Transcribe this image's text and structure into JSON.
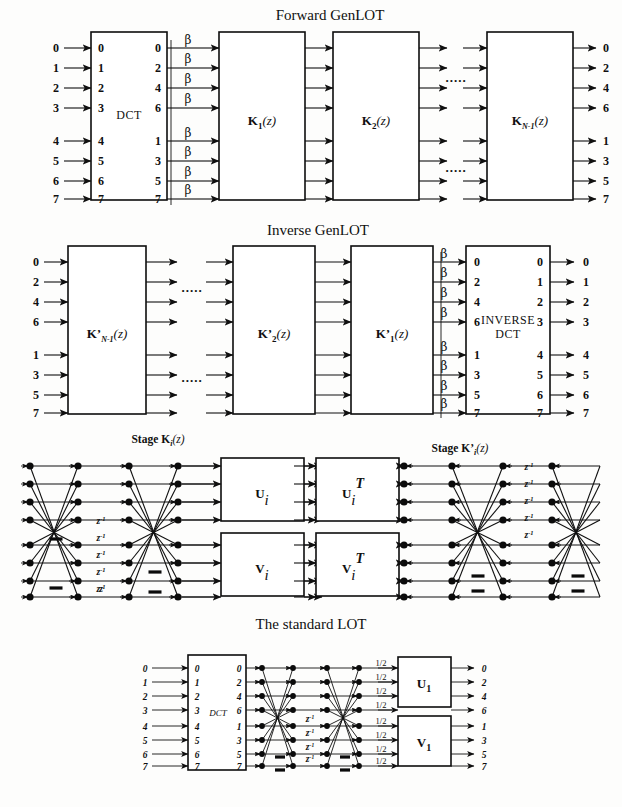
{
  "figure": {
    "kind": "signal-flow-block-diagram",
    "background": "#fdfdfc",
    "ink": "#101010"
  },
  "sections": {
    "forward": {
      "title": "Forward GenLOT",
      "input_labels": [
        "0",
        "1",
        "2",
        "3",
        "4",
        "5",
        "6",
        "7"
      ],
      "dct": {
        "label": "DCT",
        "in_ports": [
          "0",
          "1",
          "2",
          "3",
          "4",
          "5",
          "6",
          "7"
        ],
        "out_ports": [
          "0",
          "2",
          "4",
          "6",
          "1",
          "3",
          "5",
          "7"
        ]
      },
      "beta_label": "β",
      "beta_count": 8,
      "blocks": [
        {
          "name": "K1",
          "base": "K",
          "sub": "1",
          "arg": "(z)"
        },
        {
          "name": "K2",
          "base": "K",
          "sub": "2",
          "arg": "(z)"
        },
        {
          "name": "KN1",
          "base": "K",
          "sub": "N-1",
          "arg": "(z)"
        }
      ],
      "ellipsis": ".....",
      "output_labels": [
        "0",
        "2",
        "4",
        "6",
        "1",
        "3",
        "5",
        "7"
      ]
    },
    "inverse": {
      "title": "Inverse GenLOT",
      "input_labels": [
        "0",
        "2",
        "4",
        "6",
        "1",
        "3",
        "5",
        "7"
      ],
      "blocks": [
        {
          "name": "KpN1",
          "base": "K’",
          "sub": "N-1",
          "arg": "(z)"
        },
        {
          "name": "Kp2",
          "base": "K’",
          "sub": "2",
          "arg": "(z)"
        },
        {
          "name": "Kp1",
          "base": "K’",
          "sub": "1",
          "arg": "(z)"
        }
      ],
      "ellipsis": ".....",
      "beta_label": "β",
      "beta_count": 8,
      "idct": {
        "label_line1": "INVERSE",
        "label_line2": "DCT",
        "in_ports": [
          "0",
          "2",
          "4",
          "6",
          "1",
          "3",
          "5",
          "7"
        ],
        "out_ports": [
          "0",
          "1",
          "2",
          "3",
          "4",
          "5",
          "6",
          "7"
        ]
      },
      "output_labels": [
        "0",
        "1",
        "2",
        "3",
        "4",
        "5",
        "6",
        "7"
      ]
    },
    "stage_forward": {
      "title_prefix": "Stage ",
      "title_base": "K",
      "title_sub": "i",
      "title_arg": "(z)",
      "z_label": "z",
      "z_exp": "-1",
      "z_label_count": 5,
      "minus_count": 4,
      "rows": 8,
      "node_columns": 4,
      "blocks": [
        {
          "name": "Ui",
          "base": "U",
          "sub": "i",
          "sup": ""
        },
        {
          "name": "Vi",
          "base": "V",
          "sub": "i",
          "sup": ""
        }
      ]
    },
    "stage_inverse": {
      "title_prefix": "Stage ",
      "title_base": "K’",
      "title_sub": "i",
      "title_arg": "(z)",
      "z_label": "z",
      "z_exp": "-1",
      "z_label_count": 5,
      "minus_count": 4,
      "rows": 8,
      "node_columns": 4,
      "blocks": [
        {
          "name": "UiT",
          "base": "U",
          "sub": "i",
          "sup": "T"
        },
        {
          "name": "ViT",
          "base": "V",
          "sub": "i",
          "sup": "T"
        }
      ]
    },
    "lot": {
      "title": "The standard LOT",
      "input_labels": [
        "0",
        "1",
        "2",
        "3",
        "4",
        "5",
        "6",
        "7"
      ],
      "dct": {
        "label": "DCT",
        "in_ports": [
          "0",
          "1",
          "2",
          "3",
          "4",
          "5",
          "6",
          "7"
        ],
        "out_ports": [
          "0",
          "2",
          "4",
          "6",
          "1",
          "3",
          "5",
          "7"
        ]
      },
      "half_label": "1/2",
      "half_count": 8,
      "z_label": "z",
      "z_exp": "-1",
      "z_label_count": 4,
      "minus_count": 4,
      "blocks": [
        {
          "name": "U1",
          "base": "U",
          "sub": "1"
        },
        {
          "name": "V1",
          "base": "V",
          "sub": "1"
        }
      ],
      "output_labels": [
        "0",
        "2",
        "4",
        "6",
        "1",
        "3",
        "5",
        "7"
      ]
    }
  }
}
